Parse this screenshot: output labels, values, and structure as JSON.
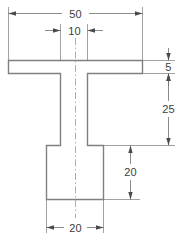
{
  "drawing": {
    "title": "T-section cross-sectional dimensioned drawing",
    "units": "mm",
    "background_color": "#ffffff",
    "outline_color": "#808080",
    "dimension_color": "#6e6e6e",
    "text_color": "#3c3c3c",
    "centerline_color": "#9a9a9a"
  },
  "dimensions": {
    "flange_width": {
      "value": "50",
      "orientation": "horizontal",
      "position": "top",
      "arrow_style": "outside-pointing-inward"
    },
    "web_width": {
      "value": "10",
      "orientation": "horizontal",
      "position": "upper-inner",
      "arrow_style": "outside-pointing-inward"
    },
    "flange_thickness": {
      "value": "5",
      "orientation": "vertical",
      "position": "right-upper",
      "arrow_style": "outside-pointing-inward"
    },
    "web_height": {
      "value": "25",
      "orientation": "vertical",
      "position": "right-middle",
      "arrow_style": "inside-pointing-outward"
    },
    "base_height": {
      "value": "20",
      "orientation": "vertical",
      "position": "right-lower",
      "arrow_style": "inside-pointing-outward"
    },
    "base_width": {
      "value": "20",
      "orientation": "horizontal",
      "position": "bottom",
      "arrow_style": "inside-pointing-outward"
    }
  },
  "geometry": {
    "shape": "T-section with widened base",
    "flange": {
      "left": 8,
      "right": 143,
      "top": 60,
      "bottom": 73
    },
    "web": {
      "left": 60,
      "right": 88,
      "top": 73,
      "bottom": 145
    },
    "base": {
      "left": 46,
      "right": 104,
      "top": 145,
      "bottom": 200
    },
    "centerline_x": 75
  }
}
